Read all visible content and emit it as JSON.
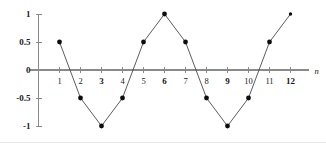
{
  "chart_data": {
    "type": "line",
    "title": "",
    "subtitle": "",
    "xlabel": "n",
    "ylabel": "",
    "x": [
      1,
      2,
      3,
      4,
      5,
      6,
      7,
      8,
      9,
      10,
      11,
      12
    ],
    "values": [
      0.5,
      -0.5,
      -1,
      -0.5,
      0.5,
      1,
      0.5,
      -0.5,
      -1,
      -0.5,
      0.5,
      1
    ],
    "series": [
      {
        "name": "x[n]",
        "values": [
          0.5,
          -0.5,
          -1,
          -0.5,
          0.5,
          1,
          0.5,
          -0.5,
          -1,
          -0.5,
          0.5,
          1
        ]
      }
    ],
    "xticks": [
      1,
      2,
      3,
      4,
      5,
      6,
      7,
      8,
      9,
      10,
      11,
      12
    ],
    "xtick_labels": [
      "1",
      "2",
      "3",
      "4",
      "5",
      "6",
      "7",
      "8",
      "9",
      "10",
      "11",
      "12"
    ],
    "xtick_bold": [
      false,
      false,
      true,
      false,
      false,
      true,
      false,
      false,
      true,
      false,
      false,
      true
    ],
    "yticks": [
      1,
      0.5,
      0,
      -0.5,
      -1
    ],
    "ytick_labels": [
      "1",
      "0.5",
      "0",
      "-0.5",
      "-1"
    ],
    "xlim": [
      0,
      12.9
    ],
    "ylim": [
      -1,
      1
    ],
    "grid": false,
    "legend": false,
    "legend_position": "none",
    "marker": "filled-circle",
    "line_color": "#4a4a4a",
    "marker_color": "#0d0d0d",
    "axis_color": "#8a8a8a",
    "background_color": "#ffffff",
    "annotations": []
  },
  "axis": {
    "x_name": "n"
  }
}
